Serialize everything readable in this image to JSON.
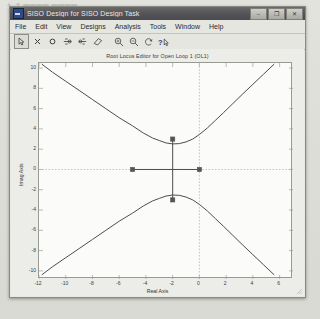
{
  "window": {
    "title": "SISO Design for SISO Design Task",
    "app_icon": "matlab-figure-icon",
    "controls": {
      "minimize": "–",
      "maximize": "❐",
      "close": "✕"
    }
  },
  "menubar": {
    "items": [
      {
        "label": "File"
      },
      {
        "label": "Edit"
      },
      {
        "label": "View"
      },
      {
        "label": "Designs"
      },
      {
        "label": "Analysis"
      },
      {
        "label": "Tools"
      },
      {
        "label": "Window"
      },
      {
        "label": "Help"
      }
    ]
  },
  "toolbar": {
    "items": [
      {
        "name": "pointer-arrow-icon",
        "glyph": "arrow",
        "selected": true,
        "tooltip": "Select"
      },
      {
        "name": "add-pole-icon",
        "glyph": "cross",
        "selected": false,
        "tooltip": "Add pole"
      },
      {
        "name": "add-zero-icon",
        "glyph": "circle",
        "selected": false,
        "tooltip": "Add zero"
      },
      {
        "name": "add-lead-network-icon",
        "glyph": "lead",
        "selected": false,
        "tooltip": "Add lead network"
      },
      {
        "name": "add-lag-network-icon",
        "glyph": "lag",
        "selected": false,
        "tooltip": "Add lag network"
      },
      {
        "name": "delete-pole-zero-icon",
        "glyph": "eraser",
        "selected": false,
        "tooltip": "Delete pole/zero"
      },
      {
        "name": "zoom-in-icon",
        "glyph": "zoom-in",
        "selected": false,
        "tooltip": "Zoom In"
      },
      {
        "name": "zoom-out-icon",
        "glyph": "zoom-out",
        "selected": false,
        "tooltip": "Zoom Out"
      },
      {
        "name": "reset-view-icon",
        "glyph": "reset",
        "selected": false,
        "tooltip": "Reset view"
      },
      {
        "name": "context-help-icon",
        "glyph": "help-arrow",
        "selected": false,
        "tooltip": "Help"
      }
    ]
  },
  "colors": {
    "locus": "#4d4d4d",
    "marker": "#555555",
    "grid": "#b9b9b4",
    "axis_line": "#8f8f8a",
    "plot_bg": "#fbfbfa",
    "window_chrome": "#e6e6e1"
  },
  "chart_data": {
    "type": "line",
    "title": "Root Locus Editor for Open Loop 1 (OL1)",
    "xlabel": "Real Axis",
    "ylabel": "Imag Axis",
    "xlim": [
      -12,
      7
    ],
    "ylim": [
      -10.8,
      10.5
    ],
    "xticks": [
      -12,
      -10,
      -8,
      -6,
      -4,
      -2,
      0,
      2,
      4,
      6
    ],
    "yticks": [
      10,
      8,
      6,
      4,
      2,
      0,
      -2,
      -4,
      -6,
      -8,
      -10
    ],
    "grid": false,
    "legend": "none",
    "dashed_vertical_line_x": 0,
    "dashed_horizontal_line_y": 0,
    "series": [
      {
        "name": "locus-branch-upper",
        "comment": "complex branch, minimum imag ~2.5 near real -2, rising to +10 at both ends",
        "points": [
          [
            -11.8,
            10.4
          ],
          [
            -11.0,
            9.6
          ],
          [
            -10.0,
            8.7
          ],
          [
            -9.0,
            7.8
          ],
          [
            -8.0,
            6.9
          ],
          [
            -7.0,
            6.0
          ],
          [
            -6.0,
            5.1
          ],
          [
            -5.0,
            4.3
          ],
          [
            -4.2,
            3.6
          ],
          [
            -3.5,
            3.1
          ],
          [
            -3.0,
            2.85
          ],
          [
            -2.5,
            2.62
          ],
          [
            -2.0,
            2.52
          ],
          [
            -1.5,
            2.55
          ],
          [
            -1.0,
            2.72
          ],
          [
            -0.5,
            3.0
          ],
          [
            0.0,
            3.45
          ],
          [
            0.6,
            4.1
          ],
          [
            1.2,
            4.85
          ],
          [
            1.8,
            5.6
          ],
          [
            2.5,
            6.5
          ],
          [
            3.2,
            7.4
          ],
          [
            4.0,
            8.4
          ],
          [
            4.8,
            9.4
          ],
          [
            5.6,
            10.4
          ]
        ]
      },
      {
        "name": "locus-branch-lower",
        "comment": "mirror image of upper branch about the real axis",
        "points": [
          [
            -11.8,
            -10.4
          ],
          [
            -11.0,
            -9.6
          ],
          [
            -10.0,
            -8.7
          ],
          [
            -9.0,
            -7.8
          ],
          [
            -8.0,
            -6.9
          ],
          [
            -7.0,
            -6.0
          ],
          [
            -6.0,
            -5.1
          ],
          [
            -5.0,
            -4.3
          ],
          [
            -4.2,
            -3.6
          ],
          [
            -3.5,
            -3.1
          ],
          [
            -3.0,
            -2.85
          ],
          [
            -2.5,
            -2.62
          ],
          [
            -2.0,
            -2.52
          ],
          [
            -1.5,
            -2.55
          ],
          [
            -1.0,
            -2.72
          ],
          [
            -0.5,
            -3.0
          ],
          [
            0.0,
            -3.45
          ],
          [
            0.6,
            -4.1
          ],
          [
            1.2,
            -4.85
          ],
          [
            1.8,
            -5.6
          ],
          [
            2.5,
            -6.5
          ],
          [
            3.2,
            -7.4
          ],
          [
            4.0,
            -8.4
          ],
          [
            4.8,
            -9.4
          ],
          [
            5.6,
            -10.4
          ]
        ]
      },
      {
        "name": "locus-segment-real-axis",
        "comment": "real axis segment between the two real markers",
        "points": [
          [
            -5.0,
            0.0
          ],
          [
            0.0,
            0.0
          ]
        ]
      },
      {
        "name": "locus-segment-vertical",
        "comment": "vertical segment joining the two complex markers through the origin",
        "points": [
          [
            -2.0,
            3.0
          ],
          [
            -2.0,
            -3.0
          ]
        ]
      }
    ],
    "markers": [
      {
        "name": "pole-marker-upper",
        "x": -2.0,
        "y": 3.0,
        "shape": "square"
      },
      {
        "name": "pole-marker-lower",
        "x": -2.0,
        "y": -3.0,
        "shape": "square"
      },
      {
        "name": "pole-marker-real-left",
        "x": -5.0,
        "y": 0.0,
        "shape": "square"
      },
      {
        "name": "pole-marker-real-right",
        "x": 0.0,
        "y": 0.0,
        "shape": "square"
      }
    ]
  }
}
